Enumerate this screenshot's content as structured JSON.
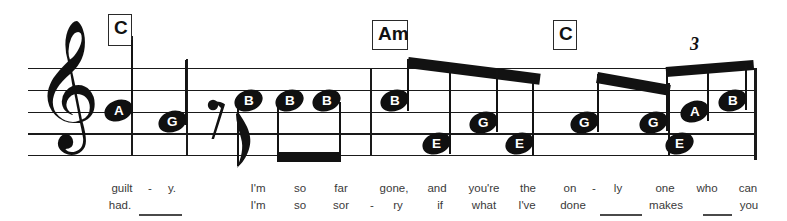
{
  "sheet": {
    "clef": "treble-clef",
    "staff": {
      "top_y": 68,
      "bottom_y": 155,
      "line_spacing": 21.75,
      "left_x": 28,
      "right_x": 756
    },
    "chords": [
      {
        "label": "C",
        "x": 108,
        "y": 14
      },
      {
        "label": "Am",
        "x": 372,
        "y": 20
      },
      {
        "label": "C",
        "x": 553,
        "y": 20
      }
    ],
    "tuplets": [
      {
        "label": "3",
        "x": 690,
        "y": 36
      }
    ],
    "rests": [
      {
        "type": "eighth-rest",
        "x": 208,
        "y": 98
      }
    ],
    "notes": [
      {
        "label": "A",
        "x": 107,
        "y": 109,
        "stem": "up",
        "group": 0
      },
      {
        "label": "G",
        "x": 161,
        "y": 120,
        "stem": "up",
        "group": 0
      },
      {
        "label": "B",
        "x": 249,
        "y": 99,
        "stem": "down",
        "group": 1
      },
      {
        "label": "B",
        "x": 290,
        "y": 99,
        "stem": "down",
        "group": 2
      },
      {
        "label": "B",
        "x": 327,
        "y": 99,
        "stem": "down",
        "group": 2
      },
      {
        "label": "B",
        "x": 390,
        "y": 99,
        "stem": "up",
        "group": 3
      },
      {
        "label": "E",
        "x": 425,
        "y": 142,
        "stem": "up",
        "group": 3
      },
      {
        "label": "G",
        "x": 473,
        "y": 121,
        "stem": "up",
        "group": 3
      },
      {
        "label": "E",
        "x": 508,
        "y": 142,
        "stem": "up",
        "group": 3
      },
      {
        "label": "G",
        "x": 548,
        "y": 121,
        "stem": "up",
        "group": 4
      },
      {
        "label": "E",
        "x": 592,
        "y": 142,
        "stem": "up",
        "group": 4
      },
      {
        "label": "G",
        "x": 640,
        "y": 121,
        "stem": "up",
        "group": 5
      },
      {
        "label": "A",
        "x": 678,
        "y": 110,
        "stem": "up",
        "group": 5
      },
      {
        "label": "B",
        "x": 717,
        "y": 99,
        "stem": "up",
        "group": 5
      }
    ],
    "barlines": [
      {
        "x": 131,
        "top": 36,
        "bottom": 155,
        "kind": "chord-stem"
      },
      {
        "x": 186,
        "top": 59,
        "bottom": 155,
        "kind": "measure"
      },
      {
        "x": 370,
        "top": 68,
        "bottom": 155,
        "kind": "measure"
      },
      {
        "x": 755,
        "top": 68,
        "bottom": 160,
        "kind": "end"
      }
    ],
    "lyrics": {
      "verse1": [
        {
          "text": "guilt",
          "x": 122
        },
        {
          "text": "-",
          "x": 150
        },
        {
          "text": "y.",
          "x": 172
        },
        {
          "text": "I'm",
          "x": 258
        },
        {
          "text": "so",
          "x": 300
        },
        {
          "text": "far",
          "x": 341
        },
        {
          "text": "gone,",
          "x": 394
        },
        {
          "text": "and",
          "x": 437
        },
        {
          "text": "you're",
          "x": 484
        },
        {
          "text": "the",
          "x": 528
        },
        {
          "text": "on",
          "x": 570
        },
        {
          "text": "-",
          "x": 594
        },
        {
          "text": "ly",
          "x": 618
        },
        {
          "text": "one",
          "x": 665
        },
        {
          "text": "who",
          "x": 707
        },
        {
          "text": "can",
          "x": 748
        }
      ],
      "verse2": [
        {
          "text": "had.",
          "x": 120
        },
        {
          "text": "I'm",
          "x": 258
        },
        {
          "text": "so",
          "x": 300
        },
        {
          "text": "sor",
          "x": 341
        },
        {
          "text": "-",
          "x": 372
        },
        {
          "text": "ry",
          "x": 398
        },
        {
          "text": "if",
          "x": 440
        },
        {
          "text": "what",
          "x": 484
        },
        {
          "text": "I've",
          "x": 527
        },
        {
          "text": "done",
          "x": 573
        },
        {
          "text": "makes",
          "x": 666
        },
        {
          "text": "you",
          "x": 749
        }
      ],
      "extenders": [
        {
          "x": 139,
          "y": 214,
          "width": 43
        },
        {
          "x": 600,
          "y": 214,
          "width": 42
        },
        {
          "x": 703,
          "y": 214,
          "width": 29
        }
      ]
    }
  },
  "colors": {
    "ink": "#101010",
    "staff": "#1a1a1a",
    "lyric": "#3a3a3a",
    "paper": "#ffffff"
  }
}
